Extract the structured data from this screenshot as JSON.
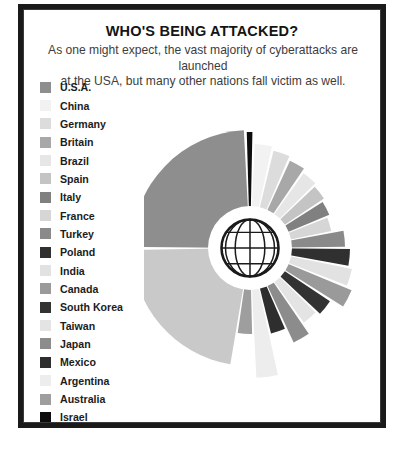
{
  "frame": {
    "border_color": "#1a1a1a",
    "background": "#ffffff"
  },
  "header": {
    "title": "WHO'S BEING ATTACKED?",
    "subtitle_line1": "As one might expect, the vast majority of cyberattacks are launched",
    "subtitle_line2": "at the USA, but many other nations fall victim as well."
  },
  "legend": {
    "items": [
      {
        "label": "U.S.A.",
        "color": "#8e8e8e"
      },
      {
        "label": "China",
        "color": "#f2f2f2"
      },
      {
        "label": "Germany",
        "color": "#dcdcdc"
      },
      {
        "label": "Britain",
        "color": "#a8a8a8"
      },
      {
        "label": "Brazil",
        "color": "#e6e6e6"
      },
      {
        "label": "Spain",
        "color": "#c4c4c4"
      },
      {
        "label": "Italy",
        "color": "#808080"
      },
      {
        "label": "France",
        "color": "#d6d6d6"
      },
      {
        "label": "Turkey",
        "color": "#8a8a8a"
      },
      {
        "label": "Poland",
        "color": "#303030"
      },
      {
        "label": "India",
        "color": "#e2e2e2"
      },
      {
        "label": "Canada",
        "color": "#9a9a9a"
      },
      {
        "label": "South Korea",
        "color": "#333333"
      },
      {
        "label": "Taiwan",
        "color": "#e4e4e4"
      },
      {
        "label": "Japan",
        "color": "#8c8c8c"
      },
      {
        "label": "Mexico",
        "color": "#2e2e2e"
      },
      {
        "label": "Argentina",
        "color": "#ededed"
      },
      {
        "label": "Australia",
        "color": "#9e9e9e"
      },
      {
        "label": "Israel",
        "color": "#0d0d0d"
      },
      {
        "label": "All Other Countries",
        "color": "#c9c9c9"
      }
    ]
  },
  "center_icon": {
    "name": "globe-icon",
    "ring_color": "#ffffff",
    "line_color": "#1a1a1a"
  },
  "chart_data": {
    "type": "pie",
    "variant": "polar-area-rose",
    "title": "WHO'S BEING ATTACKED?",
    "subtitle": "As one might expect, the vast majority of cyberattacks are launched at the USA, but many other nations fall victim as well.",
    "xlabel": "",
    "ylabel": "",
    "legend_position": "left",
    "grid": false,
    "center": {
      "x": 106,
      "y": 176
    },
    "inner_radius": 42,
    "units": "share of cyberattacks (relative)",
    "categories": [
      "U.S.A.",
      "Israel",
      "China",
      "Germany",
      "Britain",
      "Brazil",
      "Spain",
      "Italy",
      "France",
      "Turkey",
      "Poland",
      "India",
      "Canada",
      "South Korea",
      "Taiwan",
      "Japan",
      "Mexico",
      "Argentina",
      "Australia",
      "All Other Countries"
    ],
    "slices": [
      {
        "name": "U.S.A.",
        "color": "#8e8e8e",
        "angle_start": 270.5,
        "angle_end": 357.0,
        "radius": 118,
        "value": 46.0
      },
      {
        "name": "Israel",
        "color": "#0d0d0d",
        "angle_start": 358.4,
        "angle_end": 361.2,
        "radius": 116,
        "value": 1.2
      },
      {
        "name": "China",
        "color": "#f2f2f2",
        "angle_start": 362.6,
        "angle_end": 372.2,
        "radius": 104,
        "value": 5.4
      },
      {
        "name": "Germany",
        "color": "#dcdcdc",
        "angle_start": 373.6,
        "angle_end": 383.2,
        "radius": 100,
        "value": 5.0
      },
      {
        "name": "Britain",
        "color": "#a8a8a8",
        "angle_start": 384.6,
        "angle_end": 394.2,
        "radius": 96,
        "value": 4.7
      },
      {
        "name": "Brazil",
        "color": "#e6e6e6",
        "angle_start": 395.6,
        "angle_end": 405.2,
        "radius": 92,
        "value": 4.4
      },
      {
        "name": "Spain",
        "color": "#c4c4c4",
        "angle_start": 406.6,
        "angle_end": 416.2,
        "radius": 89,
        "value": 4.1
      },
      {
        "name": "Italy",
        "color": "#808080",
        "angle_start": 417.6,
        "angle_end": 427.2,
        "radius": 86,
        "value": 3.8
      },
      {
        "name": "France",
        "color": "#d6d6d6",
        "angle_start": 428.6,
        "angle_end": 438.2,
        "radius": 83,
        "value": 3.5
      },
      {
        "name": "Turkey",
        "color": "#8a8a8a",
        "angle_start": 439.6,
        "angle_end": 449.2,
        "radius": 95,
        "value": 4.6
      },
      {
        "name": "Poland",
        "color": "#303030",
        "angle_start": 450.6,
        "angle_end": 460.2,
        "radius": 100,
        "value": 5.0
      },
      {
        "name": "India",
        "color": "#e2e2e2",
        "angle_start": 461.6,
        "angle_end": 471.2,
        "radius": 104,
        "value": 5.3
      },
      {
        "name": "Canada",
        "color": "#9a9a9a",
        "angle_start": 472.6,
        "angle_end": 482.2,
        "radius": 110,
        "value": 5.8
      },
      {
        "name": "South Korea",
        "color": "#333333",
        "angle_start": 483.6,
        "angle_end": 493.2,
        "radius": 96,
        "value": 4.7
      },
      {
        "name": "Taiwan",
        "color": "#e4e4e4",
        "angle_start": 494.6,
        "angle_end": 504.2,
        "radius": 92,
        "value": 4.4
      },
      {
        "name": "Japan",
        "color": "#8c8c8c",
        "angle_start": 505.6,
        "angle_end": 515.2,
        "radius": 104,
        "value": 5.3
      },
      {
        "name": "Mexico",
        "color": "#2e2e2e",
        "angle_start": 516.6,
        "angle_end": 526.2,
        "radius": 88,
        "value": 4.0
      },
      {
        "name": "Argentina",
        "color": "#ededed",
        "angle_start": 527.6,
        "angle_end": 537.2,
        "radius": 130,
        "value": 7.2
      },
      {
        "name": "Australia",
        "color": "#9e9e9e",
        "angle_start": 538.6,
        "angle_end": 548.2,
        "radius": 86,
        "value": 3.8
      },
      {
        "name": "All Other Countries",
        "color": "#c9c9c9",
        "angle_start": 549.6,
        "angle_end": 629.0,
        "radius": 118,
        "value": 42.0
      }
    ]
  }
}
